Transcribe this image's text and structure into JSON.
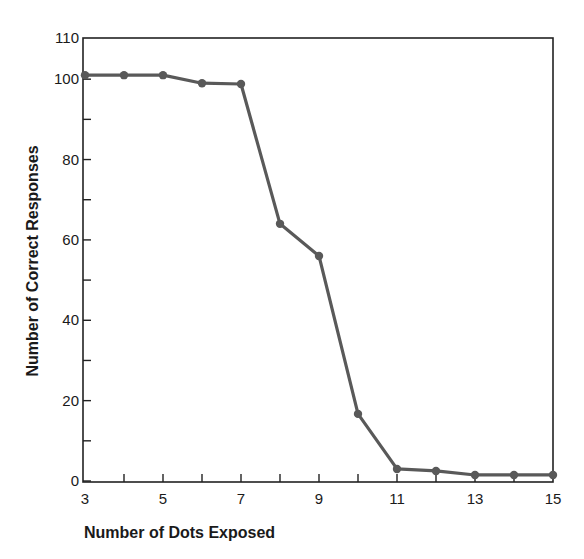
{
  "chart_data": {
    "type": "line",
    "title": "",
    "xlabel": "Number of Dots Exposed",
    "ylabel": "Number of Correct Responses",
    "x": [
      3,
      4,
      5,
      6,
      7,
      8,
      9,
      10,
      11,
      12,
      13,
      14,
      15
    ],
    "series": [
      {
        "name": "Correct Responses",
        "values": [
          101,
          101,
          101,
          99,
          98.8,
          64,
          56,
          16.7,
          3,
          2.5,
          1.5,
          1.5,
          1.5
        ],
        "color": "#595959",
        "marker": "circle"
      }
    ],
    "xlim": [
      3,
      15
    ],
    "ylim": [
      0,
      110
    ],
    "x_ticks": [
      3,
      4,
      5,
      6,
      7,
      8,
      9,
      10,
      11,
      12,
      13,
      14,
      15
    ],
    "x_tick_labels": [
      "3",
      "5",
      "7",
      "9",
      "11",
      "13",
      "15"
    ],
    "x_tick_label_values": [
      3,
      5,
      7,
      9,
      11,
      13,
      15
    ],
    "y_ticks": [
      0,
      10,
      20,
      30,
      40,
      50,
      60,
      70,
      80,
      90,
      100,
      110
    ],
    "y_tick_labels": [
      "0",
      "20",
      "40",
      "60",
      "80",
      "100",
      "110"
    ],
    "y_tick_label_values": [
      0,
      20,
      40,
      60,
      80,
      100,
      110
    ],
    "grid": false,
    "legend": null
  }
}
